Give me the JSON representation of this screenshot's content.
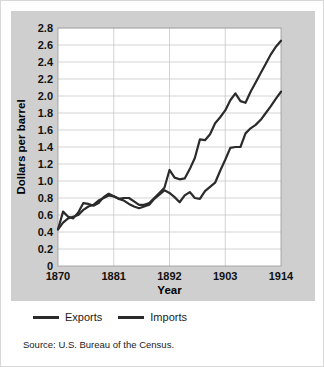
{
  "figure": {
    "background_color": "#ffffff",
    "panel_color": "#cfcfcf",
    "plot_area_color": "#ffffff",
    "line_color": "#2b2b2b",
    "grid_color": "#c8c8c8"
  },
  "legend": {
    "position": "below-plot",
    "entries": [
      {
        "label": "Exports",
        "color": "#2b2b2b"
      },
      {
        "label": "Imports",
        "color": "#2b2b2b"
      }
    ]
  },
  "source": {
    "text": "Source: U.S. Bureau of the Census."
  },
  "chart_data": {
    "type": "line",
    "title": "",
    "subtitle": "",
    "xlabel": "Year",
    "ylabel": "Dollars per barrel",
    "xlim": [
      1870,
      1914
    ],
    "ylim": [
      0,
      2.8
    ],
    "grid": true,
    "legend_position": "bottom",
    "x_ticks": [
      1870,
      1881,
      1892,
      1903,
      1914
    ],
    "x_tick_labels": [
      "1870",
      "1881",
      "1892",
      "1903",
      "1914"
    ],
    "y_ticks": [
      0,
      0.2,
      0.4,
      0.6,
      0.8,
      1.0,
      1.2,
      1.4,
      1.6,
      1.8,
      2.0,
      2.2,
      2.4,
      2.6,
      2.8
    ],
    "y_tick_labels": [
      "0",
      "0.2",
      "0.4",
      "0.6",
      "0.8",
      "1.0",
      "1.2",
      "1.4",
      "1.6",
      "1.8",
      "2.0",
      "2.2",
      "2.4",
      "2.6",
      "2.8"
    ],
    "x": [
      1870,
      1871,
      1872,
      1873,
      1874,
      1875,
      1876,
      1877,
      1878,
      1879,
      1880,
      1881,
      1882,
      1883,
      1884,
      1885,
      1886,
      1887,
      1888,
      1889,
      1890,
      1891,
      1892,
      1893,
      1894,
      1895,
      1896,
      1897,
      1898,
      1899,
      1900,
      1901,
      1902,
      1903,
      1904,
      1905,
      1906,
      1907,
      1908,
      1909,
      1910,
      1911,
      1912,
      1913,
      1914
    ],
    "series": [
      {
        "name": "Exports",
        "color": "#2b2b2b",
        "values": [
          0.43,
          0.64,
          0.58,
          0.56,
          0.63,
          0.74,
          0.73,
          0.71,
          0.74,
          0.81,
          0.85,
          0.82,
          0.79,
          0.8,
          0.8,
          0.76,
          0.72,
          0.72,
          0.74,
          0.8,
          0.86,
          0.92,
          1.13,
          1.04,
          1.02,
          1.03,
          1.14,
          1.27,
          1.49,
          1.48,
          1.55,
          1.68,
          1.75,
          1.83,
          1.95,
          2.03,
          1.94,
          1.92,
          2.05,
          2.16,
          2.27,
          2.38,
          2.49,
          2.58,
          2.65
        ]
      },
      {
        "name": "Imports",
        "color": "#2b2b2b",
        "values": [
          0.43,
          0.51,
          0.56,
          0.58,
          0.6,
          0.66,
          0.7,
          0.72,
          0.77,
          0.8,
          0.83,
          0.82,
          0.79,
          0.77,
          0.73,
          0.7,
          0.68,
          0.7,
          0.72,
          0.79,
          0.84,
          0.89,
          0.86,
          0.81,
          0.75,
          0.83,
          0.87,
          0.8,
          0.79,
          0.88,
          0.93,
          0.98,
          1.12,
          1.25,
          1.39,
          1.4,
          1.4,
          1.56,
          1.62,
          1.66,
          1.72,
          1.8,
          1.88,
          1.97,
          2.05
        ]
      }
    ]
  }
}
